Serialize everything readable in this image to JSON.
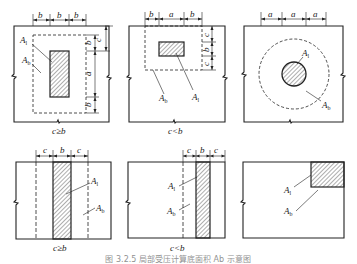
{
  "figure": {
    "caption": "图 3.2.5  局部受压计算底面积 Ab 示意图",
    "panels": [
      {
        "id": "rect-center",
        "condition": "c≥b",
        "dims_top": [
          "b",
          "b",
          "b"
        ],
        "dims_right": [
          "c",
          "b",
          "a",
          "b"
        ],
        "labels": {
          "A1": "A",
          "A1_sub": "l",
          "Ab": "A",
          "Ab_sub": "b"
        }
      },
      {
        "id": "rect-wide",
        "condition": "c<b",
        "dims_top": [
          "b",
          "a",
          "b"
        ],
        "dims_right": [
          "c",
          "b",
          "c"
        ],
        "labels": {
          "A1": "A",
          "A1_sub": "l",
          "Ab": "A",
          "Ab_sub": "b"
        }
      },
      {
        "id": "circle",
        "condition": "",
        "dims_top": [
          "a",
          "a",
          "a"
        ],
        "labels": {
          "A1": "A",
          "A1_sub": "l",
          "Ab": "A",
          "Ab_sub": "b"
        }
      },
      {
        "id": "strip-wide",
        "condition": "c≥b",
        "dims_top": [
          "c",
          "b",
          "c"
        ],
        "labels": {
          "A1": "A",
          "A1_sub": "l",
          "Ab": "A",
          "Ab_sub": "b"
        }
      },
      {
        "id": "strip-edge",
        "condition": "c<b",
        "dims_top": [
          "c",
          "b",
          "c"
        ],
        "labels": {
          "A1": "A",
          "A1_sub": "l",
          "Ab": "A",
          "Ab_sub": "b"
        }
      },
      {
        "id": "corner",
        "condition": "",
        "labels": {
          "A1": "A",
          "A1_sub": "l",
          "Ab": "A",
          "Ab_sub": "b"
        }
      }
    ]
  }
}
